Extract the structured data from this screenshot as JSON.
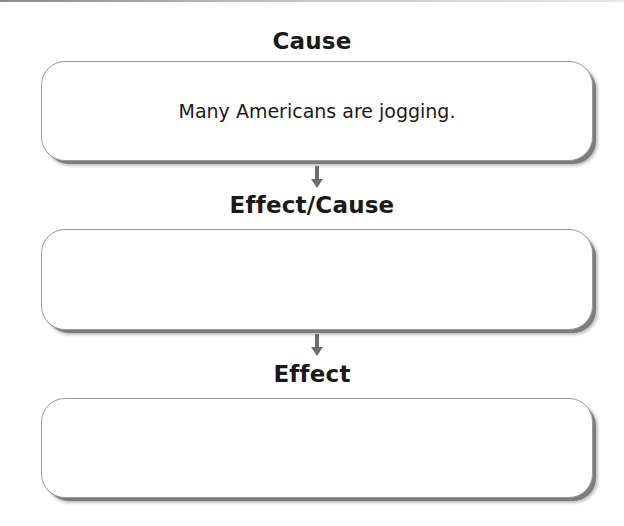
{
  "diagram": {
    "type": "cause-effect-chain",
    "nodes": [
      {
        "heading": "Cause",
        "content": "Many Americans are jogging."
      },
      {
        "heading": "Effect/Cause",
        "content": ""
      },
      {
        "heading": "Effect",
        "content": ""
      }
    ],
    "edges": [
      {
        "from": 0,
        "to": 1,
        "direction": "down"
      },
      {
        "from": 1,
        "to": 2,
        "direction": "down"
      }
    ]
  },
  "colors": {
    "box_border": "#9a9a9a",
    "box_shadow": "#7c7c7c",
    "arrow": "#6e6e6e",
    "text": "#1a1a1a"
  }
}
